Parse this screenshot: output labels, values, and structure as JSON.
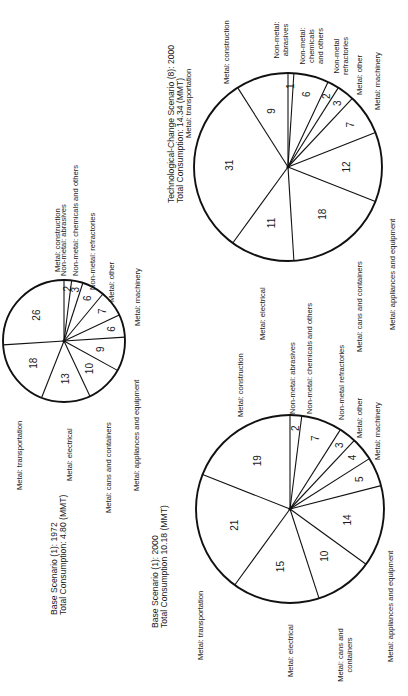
{
  "chart_data": [
    {
      "type": "pie",
      "title": "Base Scenario (1): 1972",
      "subtitle": "Total Consumption: 4.80 (MMT)",
      "center": [
        64,
        341
      ],
      "radius": 61,
      "slices": [
        {
          "label": "Non-metal: abrasives",
          "value": 2
        },
        {
          "label": "Non-metal: chemicals and others",
          "value": 3
        },
        {
          "label": "Non-metal: refractories",
          "value": 6
        },
        {
          "label": "Metal: other",
          "value": 7
        },
        {
          "label": "Metal: machinery",
          "value": 6
        },
        {
          "label": "Metal: appliances and equipment",
          "value": 9
        },
        {
          "label": "Metal: cans and containers",
          "value": 10
        },
        {
          "label": "Metal: electrical",
          "value": 13
        },
        {
          "label": "Metal: transportation",
          "value": 18
        },
        {
          "label": "Metal: construction",
          "value": 26
        }
      ],
      "labels": [
        {
          "lines": [
            "Metal: construction"
          ],
          "x": 60,
          "y": 272
        },
        {
          "lines": [
            "Non-metal: abrasives"
          ],
          "x": 66,
          "y": 276
        },
        {
          "lines": [
            "Non-metal: chemicals and others"
          ],
          "x": 78,
          "y": 276
        },
        {
          "lines": [
            "Non-metal: refractories"
          ],
          "x": 95,
          "y": 290
        },
        {
          "lines": [
            "Metal: other"
          ],
          "x": 114,
          "y": 302
        },
        {
          "lines": [
            "Metal: machinery"
          ],
          "x": 140,
          "y": 326
        },
        {
          "lines": [
            "Metal: appliances and equipment"
          ],
          "x": 139,
          "y": 491
        },
        {
          "lines": [
            "Metal: cans and containers"
          ],
          "x": 111,
          "y": 513
        },
        {
          "lines": [
            "Metal: electrical"
          ],
          "x": 72,
          "y": 481
        },
        {
          "lines": [
            "Metal: transportation"
          ],
          "x": 22,
          "y": 490
        }
      ],
      "title_pos": {
        "x": 57,
        "y": 615,
        "dx": 9
      }
    },
    {
      "type": "pie",
      "title": "Technological-Change Scenario (8): 2000",
      "subtitle": "Total Consumption: 14.34 (MMT)",
      "center": [
        288,
        167
      ],
      "radius": 94,
      "slices": [
        {
          "label": "Non-metal: abrasives",
          "value": 1
        },
        {
          "label": "Non-metal: chemicals and others",
          "value": 6
        },
        {
          "label": "Non-metal refractories",
          "value": 2
        },
        {
          "label": "Metal: other",
          "value": 3
        },
        {
          "label": "Metal: machinery",
          "value": 7
        },
        {
          "label": "Metal: appliances and equipment",
          "value": 12
        },
        {
          "label": "Metal: cans and containers",
          "value": 18
        },
        {
          "label": "Metal: electrical",
          "value": 11
        },
        {
          "label": "Metal: transportation",
          "value": 31
        },
        {
          "label": "Metal: construction",
          "value": 9
        }
      ],
      "labels": [
        {
          "lines": [
            "Metal: construction"
          ],
          "x": 229,
          "y": 84
        },
        {
          "lines": [
            "Non-metal:",
            "abrasives"
          ],
          "x": 279,
          "y": 62,
          "center": true
        },
        {
          "lines": [
            "Non-metal:",
            "chemicals",
            "and others"
          ],
          "x": 305,
          "y": 68,
          "center": true
        },
        {
          "lines": [
            "Non-metal",
            "refractories"
          ],
          "x": 339,
          "y": 78,
          "center": true
        },
        {
          "lines": [
            "Metal: other"
          ],
          "x": 362,
          "y": 95
        },
        {
          "lines": [
            "Metal: machinery"
          ],
          "x": 380,
          "y": 110
        },
        {
          "lines": [
            "Metal: appliances and equipment"
          ],
          "x": 395,
          "y": 330
        },
        {
          "lines": [
            "Metal: cans and containers"
          ],
          "x": 362,
          "y": 352
        },
        {
          "lines": [
            "Metal: electrical"
          ],
          "x": 265,
          "y": 340
        },
        {
          "lines": [
            "Metal: transportation"
          ],
          "x": 191,
          "y": 138
        }
      ],
      "title_pos": {
        "x": 174,
        "y": 203,
        "dx": 9
      }
    },
    {
      "type": "pie",
      "title": "Base Scenario (1): 2000",
      "subtitle": "Total Consumption 10.18 (MMT)",
      "center": [
        290,
        509
      ],
      "radius": 94,
      "slices": [
        {
          "label": "Non-metal: abrasives",
          "value": 2
        },
        {
          "label": "Non-metal: chemicals and others",
          "value": 7
        },
        {
          "label": "Non-metal refractories",
          "value": 3
        },
        {
          "label": "Metal: other",
          "value": 4
        },
        {
          "label": "Metal: machinery",
          "value": 5
        },
        {
          "label": "Metal: appliances and equipment",
          "value": 14
        },
        {
          "label": "Metal: cans and containers",
          "value": 10
        },
        {
          "label": "Metal: electrical",
          "value": 15
        },
        {
          "label": "Metal: transportation",
          "value": 21
        },
        {
          "label": "Metal: construction",
          "value": 19
        }
      ],
      "labels": [
        {
          "lines": [
            "Metal: construction"
          ],
          "x": 243,
          "y": 417
        },
        {
          "lines": [
            "Non-metal: abrasives"
          ],
          "x": 295,
          "y": 414
        },
        {
          "lines": [
            "Non-metal: chemicals and others"
          ],
          "x": 312,
          "y": 414
        },
        {
          "lines": [
            "Non-metal refractories"
          ],
          "x": 344,
          "y": 420
        },
        {
          "lines": [
            "Metal: other"
          ],
          "x": 362,
          "y": 438
        },
        {
          "lines": [
            "Metal: machinery"
          ],
          "x": 380,
          "y": 460
        },
        {
          "lines": [
            "Metal: appliances and equipment"
          ],
          "x": 393,
          "y": 662
        },
        {
          "lines": [
            "Metal: cans and",
            "containers"
          ],
          "x": 343,
          "y": 677,
          "center": true
        },
        {
          "lines": [
            "Metal: electrical"
          ],
          "x": 293,
          "y": 677
        },
        {
          "lines": [
            "Metal: transportation"
          ],
          "x": 203,
          "y": 660
        }
      ],
      "title_pos": {
        "x": 158,
        "y": 628,
        "dx": 9
      }
    }
  ]
}
